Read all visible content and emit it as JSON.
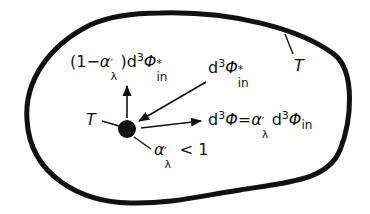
{
  "colors": {
    "ink": "#111111",
    "background": "#ffffff"
  },
  "labels": {
    "reflected": {
      "prefix": "(1−",
      "alpha": "α",
      "alpha_prime": "′",
      "alpha_sub": "λ",
      "close": ")",
      "d": "d",
      "exp": "3",
      "phi": "Φ",
      "star": "*",
      "sub": "in"
    },
    "incident": {
      "d": "d",
      "exp": "3",
      "phi": "Φ",
      "star": "*",
      "sub": "in"
    },
    "emitted": {
      "lhs_d": "d",
      "lhs_exp": "3",
      "lhs_phi": "Φ",
      "eq": "=",
      "alpha": "α",
      "alpha_prime": "′",
      "alpha_sub": "λ",
      "rhs_d": "d",
      "rhs_exp": "3",
      "rhs_phi": "Φ",
      "rhs_sub": "in"
    },
    "body_temperature": "T",
    "wall_temperature": "T",
    "absorptivity": {
      "alpha": "α",
      "alpha_prime": "′",
      "alpha_sub": "λ",
      "relation": " < 1"
    }
  }
}
